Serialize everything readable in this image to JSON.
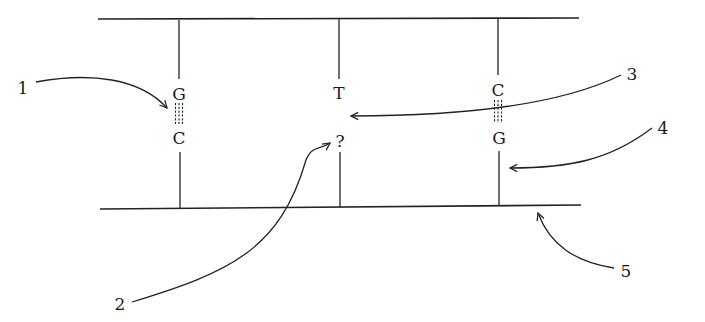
{
  "diagram": {
    "strands": [
      "top-backbone",
      "bottom-backbone"
    ],
    "pairs": [
      {
        "top": "G",
        "bottom": "C",
        "bonds": 3
      },
      {
        "top": "T",
        "bottom": "?",
        "bonds": 0
      },
      {
        "top": "C",
        "bottom": "G",
        "bonds": 3
      }
    ],
    "labels": [
      {
        "id": "1",
        "text": "1",
        "target": "hydrogen bonds between G and C"
      },
      {
        "id": "2",
        "text": "2",
        "target": "unknown base (?)"
      },
      {
        "id": "3",
        "text": "3",
        "target": "gap between T and ?"
      },
      {
        "id": "4",
        "text": "4",
        "target": "right rung (lower segment)"
      },
      {
        "id": "5",
        "text": "5",
        "target": "bottom backbone strand"
      }
    ],
    "colors": {
      "ink": "#222222",
      "background": "#ffffff"
    }
  }
}
